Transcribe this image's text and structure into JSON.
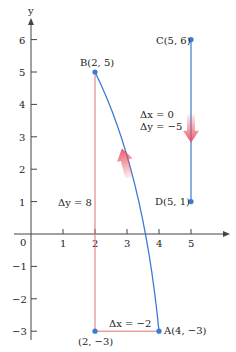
{
  "axes": {
    "x_label": "",
    "y_label": "y",
    "origin_label": "0",
    "x_ticks": [
      "1",
      "2",
      "3",
      "4",
      "5"
    ],
    "y_ticks": [
      "6",
      "5",
      "4",
      "3",
      "2",
      "1",
      "−1",
      "−2",
      "−3"
    ]
  },
  "points": {
    "A": {
      "label": "A(4, −3)",
      "x": 4,
      "y": -3
    },
    "B": {
      "label": "B(2, 5)",
      "x": 2,
      "y": 5
    },
    "C": {
      "label": "C(5, 6)",
      "x": 5,
      "y": 6
    },
    "D": {
      "label": "D(5, 1)",
      "x": 5,
      "y": 1
    },
    "corner": {
      "label": "(2, −3)",
      "x": 2,
      "y": -3
    }
  },
  "annotations": {
    "dx_cd": "Δx = 0",
    "dy_cd": "Δy = −5",
    "dy_ab": "Δy = 8",
    "dx_ab": "Δx = −2"
  },
  "colors": {
    "curve": "#3a7bd5",
    "segment": "#6a9fd8",
    "right_triangle": "#e07070",
    "arrow": "#e8485a",
    "axis": "#444444"
  }
}
